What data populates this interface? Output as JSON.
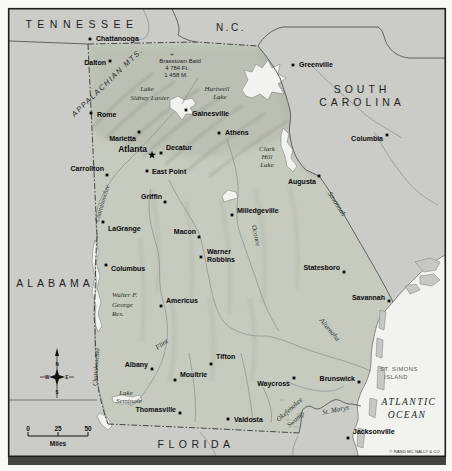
{
  "colors": {
    "land": "#cbcbc7",
    "georgia": "#c6cabf",
    "water": "#f2f3ee",
    "river": "#899090",
    "ink": "#1c1c1c"
  },
  "labels": {
    "states": [
      {
        "text": "TENNESSEE",
        "x": 82,
        "y": 28,
        "size": 10.5,
        "ls": 5.5
      },
      {
        "text": "N.C.",
        "x": 231,
        "y": 31,
        "size": 10,
        "ls": 2.5
      },
      {
        "text": "SOUTH",
        "x": 362,
        "y": 93,
        "size": 10.5,
        "ls": 4
      },
      {
        "text": "CAROLINA",
        "x": 362,
        "y": 106,
        "size": 10.5,
        "ls": 4
      },
      {
        "text": "ALABAMA",
        "x": 55,
        "y": 287,
        "size": 10.5,
        "ls": 4
      },
      {
        "text": "FLORIDA",
        "x": 196,
        "y": 448,
        "size": 10.5,
        "ls": 4.5
      }
    ],
    "ocean": [
      {
        "text": "ATLANTIC",
        "x": 409,
        "y": 405
      },
      {
        "text": "OCEAN",
        "x": 407,
        "y": 418
      }
    ],
    "water": [
      {
        "text": "Lake",
        "x": 147,
        "y": 91
      },
      {
        "text": "Sidney Lanier",
        "x": 150,
        "y": 100
      },
      {
        "text": "Hartwell",
        "x": 217,
        "y": 91
      },
      {
        "text": "Lake",
        "x": 220,
        "y": 99
      },
      {
        "text": "Clark",
        "x": 267,
        "y": 151
      },
      {
        "text": "Hill",
        "x": 267,
        "y": 159
      },
      {
        "text": "Lake",
        "x": 267,
        "y": 167
      },
      {
        "text": "Walter F.",
        "x": 112,
        "y": 297,
        "a": "start"
      },
      {
        "text": "George",
        "x": 112,
        "y": 307,
        "a": "start"
      },
      {
        "text": "Res.",
        "x": 112,
        "y": 316,
        "a": "start"
      },
      {
        "text": "Lake",
        "x": 126,
        "y": 395
      },
      {
        "text": "Seminole",
        "x": 129,
        "y": 403
      },
      {
        "text": "Savannah",
        "x": 335,
        "y": 205,
        "r": 57
      },
      {
        "text": "Oconee",
        "x": 254,
        "y": 236,
        "r": 78
      },
      {
        "text": "Altamaha",
        "x": 328,
        "y": 331,
        "r": 50
      },
      {
        "text": "Flint",
        "x": 163,
        "y": 346,
        "r": -36
      },
      {
        "text": "Chattahoochee",
        "x": 104,
        "y": 204,
        "r": -73,
        "size": 6.3
      },
      {
        "text": "Chattahoochee",
        "x": 98,
        "y": 367,
        "r": -86,
        "size": 6.3
      },
      {
        "text": "St. Marys",
        "x": 336,
        "y": 412,
        "r": -12
      },
      {
        "text": "Okefenokee",
        "x": 291,
        "y": 411,
        "r": -42
      },
      {
        "text": "Swamp",
        "x": 297,
        "y": 421,
        "r": -42
      }
    ],
    "features": [
      {
        "text": "APPALACHIAN MTS.",
        "x": 109,
        "y": 84,
        "r": -44,
        "cls": "mts"
      },
      {
        "text": "+",
        "x": 172,
        "y": 56,
        "cls": "peak"
      },
      {
        "text": "Brasstown Bald",
        "x": 180,
        "y": 63,
        "cls": "peak"
      },
      {
        "text": "4 784 Ft.",
        "x": 177,
        "y": 70,
        "cls": "peak"
      },
      {
        "text": "1 458 M.",
        "x": 176,
        "y": 77,
        "cls": "peak"
      },
      {
        "text": "ST. SIMONS",
        "x": 399,
        "y": 371,
        "cls": "island"
      },
      {
        "text": "ISLAND",
        "x": 396,
        "y": 379,
        "cls": "island"
      }
    ]
  },
  "cities": [
    {
      "name": "Chattanooga",
      "x": 90,
      "y": 39,
      "lx": 96,
      "ly": 41,
      "a": "start"
    },
    {
      "name": "Dalton",
      "x": 110,
      "y": 61,
      "lx": 106,
      "ly": 65,
      "a": "end"
    },
    {
      "name": "Rome",
      "x": 91,
      "y": 113,
      "lx": 97,
      "ly": 117,
      "a": "start"
    },
    {
      "name": "Greenville",
      "x": 293,
      "y": 65,
      "lx": 299,
      "ly": 67,
      "a": "start"
    },
    {
      "name": "Gainesville",
      "x": 186,
      "y": 110,
      "lx": 192,
      "ly": 116,
      "a": "start"
    },
    {
      "name": "Athens",
      "x": 219,
      "y": 133,
      "lx": 225,
      "ly": 135,
      "a": "start"
    },
    {
      "name": "Marietta",
      "x": 139,
      "y": 132,
      "lx": 136,
      "ly": 141,
      "a": "end"
    },
    {
      "name": "Atlanta",
      "x": 152,
      "y": 155,
      "lx": 147,
      "ly": 152,
      "a": "end",
      "star": true,
      "size": 8.5
    },
    {
      "name": "Decatur",
      "x": 161,
      "y": 153,
      "lx": 166,
      "ly": 150,
      "a": "start"
    },
    {
      "name": "East Point",
      "x": 147,
      "y": 171,
      "lx": 152,
      "ly": 174,
      "a": "start"
    },
    {
      "name": "Carrollton",
      "x": 107,
      "y": 175,
      "lx": 104,
      "ly": 171,
      "a": "end"
    },
    {
      "name": "Griffin",
      "x": 165,
      "y": 202,
      "lx": 162,
      "ly": 199,
      "a": "end"
    },
    {
      "name": "LaGrange",
      "x": 103,
      "y": 222,
      "lx": 108,
      "ly": 231,
      "a": "start"
    },
    {
      "name": "Macon",
      "x": 199,
      "y": 237,
      "lx": 196,
      "ly": 234,
      "a": "end"
    },
    {
      "name": "Milledgeville",
      "x": 232,
      "y": 215,
      "lx": 237,
      "ly": 213,
      "a": "start"
    },
    {
      "name": "Warner Robbins",
      "lines": [
        "Warner",
        "Robbins"
      ],
      "x": 201,
      "y": 257,
      "lx": 207,
      "ly": 254,
      "a": "start"
    },
    {
      "name": "Columbus",
      "x": 106,
      "y": 265,
      "lx": 111,
      "ly": 271,
      "a": "start"
    },
    {
      "name": "Americus",
      "x": 161,
      "y": 306,
      "lx": 166,
      "ly": 303,
      "a": "start"
    },
    {
      "name": "Albany",
      "x": 152,
      "y": 369,
      "lx": 148,
      "ly": 367,
      "a": "end"
    },
    {
      "name": "Thomasville",
      "x": 180,
      "y": 413,
      "lx": 176,
      "ly": 412,
      "a": "end"
    },
    {
      "name": "Tifton",
      "x": 211,
      "y": 364,
      "lx": 216,
      "ly": 359,
      "a": "start"
    },
    {
      "name": "Moultrie",
      "x": 175,
      "y": 380,
      "lx": 180,
      "ly": 377,
      "a": "start"
    },
    {
      "name": "Valdosta",
      "x": 228,
      "y": 419,
      "lx": 234,
      "ly": 422,
      "a": "start"
    },
    {
      "name": "Waycross",
      "x": 294,
      "y": 378,
      "lx": 290,
      "ly": 386,
      "a": "end"
    },
    {
      "name": "Brunswick",
      "x": 359,
      "y": 382,
      "lx": 355,
      "ly": 381,
      "a": "end"
    },
    {
      "name": "Savannah",
      "x": 389,
      "y": 301,
      "lx": 385,
      "ly": 300,
      "a": "end"
    },
    {
      "name": "Statesboro",
      "x": 344,
      "y": 272,
      "lx": 340,
      "ly": 270,
      "a": "end"
    },
    {
      "name": "Augusta",
      "x": 319,
      "y": 176,
      "lx": 316,
      "ly": 184,
      "a": "end"
    },
    {
      "name": "Columbia",
      "x": 387,
      "y": 135,
      "lx": 383,
      "ly": 141,
      "a": "end"
    },
    {
      "name": "Jacksonville",
      "x": 348,
      "y": 438,
      "lx": 353,
      "ly": 434,
      "a": "start"
    }
  ],
  "scale": {
    "ticks": [
      {
        "text": "0",
        "x": 28
      },
      {
        "text": "25",
        "x": 58
      },
      {
        "text": "50",
        "x": 88
      }
    ],
    "tick_y": 431,
    "unit": "Miles",
    "unit_x": 58,
    "unit_y": 446
  },
  "compass": {
    "n": "N",
    "s": "S",
    "e": "E",
    "w": "W"
  },
  "credit": {
    "text": "© RAND MC NALLY & CO.",
    "x": 441,
    "y": 453
  }
}
